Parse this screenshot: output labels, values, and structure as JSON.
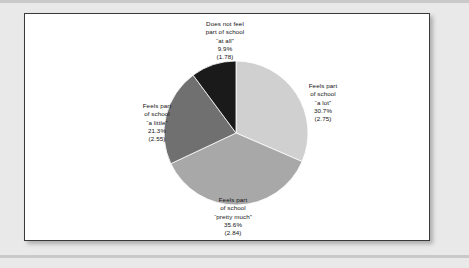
{
  "page": {
    "background_color": "#e9e9e9",
    "card_background": "#ffffff",
    "card_border_color": "#3a3a3a"
  },
  "chart_data": {
    "type": "pie",
    "title": "",
    "subtitle": "",
    "xlabel": "",
    "ylabel": "",
    "legend_position": "none",
    "grid": false,
    "start_angle_deg": 0,
    "direction": "clockwise",
    "categories": [
      "Feels part of school \"a lot\"",
      "Feels part of school \"pretty much\"",
      "Feels part of school \"a little\"",
      "Does not feel part of school \"at all\""
    ],
    "values": [
      30.7,
      35.6,
      21.3,
      9.9
    ],
    "value_unit": "percent",
    "mean_scores": [
      2.75,
      2.84,
      2.55,
      1.78
    ],
    "colors": [
      "#d0d0d0",
      "#a8a8a8",
      "#707070",
      "#1a1a1a"
    ],
    "slices": [
      {
        "id": "a-lot",
        "line1": "Feels part",
        "line2": "of school",
        "quote": "“a lot”",
        "percent": "30.7%",
        "mean": "(2.75)",
        "value": 30.7,
        "mean_value": 2.75,
        "color": "#d0d0d0"
      },
      {
        "id": "pretty-much",
        "line1": "Feels part",
        "line2": "of school",
        "quote": "“pretty much”",
        "percent": "35.6%",
        "mean": "(2.84)",
        "value": 35.6,
        "mean_value": 2.84,
        "color": "#a8a8a8"
      },
      {
        "id": "a-little",
        "line1": "Feels part",
        "line2": "of school",
        "quote": "“a little”",
        "percent": "21.3%",
        "mean": "(2.55)",
        "value": 21.3,
        "mean_value": 2.55,
        "color": "#707070"
      },
      {
        "id": "at-all",
        "line1": "Does not feel",
        "line2": "part of school",
        "quote": "“at all”",
        "percent": "9.9%",
        "mean": "(1.78)",
        "value": 9.9,
        "mean_value": 1.78,
        "color": "#1a1a1a"
      }
    ]
  }
}
